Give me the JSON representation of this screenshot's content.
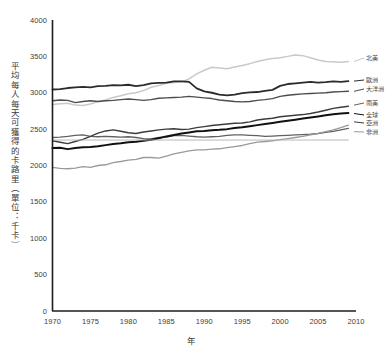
{
  "chart_data": {
    "type": "line",
    "title": "",
    "xlabel": "年",
    "ylabel": "平均每人每天可獲得的卡路里（單位：千卡）",
    "xlim": [
      1970,
      2010
    ],
    "ylim": [
      0,
      4000
    ],
    "grid": false,
    "legend_position": "right",
    "x": [
      1970,
      1971,
      1972,
      1973,
      1974,
      1975,
      1976,
      1977,
      1978,
      1979,
      1980,
      1981,
      1982,
      1983,
      1984,
      1985,
      1986,
      1987,
      1988,
      1989,
      1990,
      1991,
      1992,
      1993,
      1994,
      1995,
      1996,
      1997,
      1998,
      1999,
      2000,
      2001,
      2002,
      2003,
      2004,
      2005,
      2006,
      2007,
      2008,
      2009
    ],
    "xticks": [
      1970,
      1975,
      1980,
      1985,
      1990,
      1995,
      2000,
      2005,
      2010
    ],
    "yticks": [
      0,
      500,
      1000,
      1500,
      2000,
      2500,
      3000,
      3500,
      4000
    ],
    "series": [
      {
        "name": "北美",
        "color": "#c9c9c9",
        "width": 1.5,
        "values": [
          2840,
          2850,
          2855,
          2830,
          2825,
          2845,
          2880,
          2900,
          2935,
          2960,
          2985,
          3000,
          3030,
          3075,
          3100,
          3130,
          3140,
          3150,
          3190,
          3260,
          3310,
          3350,
          3340,
          3330,
          3355,
          3375,
          3400,
          3430,
          3455,
          3470,
          3480,
          3500,
          3520,
          3510,
          3480,
          3450,
          3430,
          3425,
          3420,
          3430
        ]
      },
      {
        "name": "歐洲",
        "color": "#2b2b2b",
        "width": 1.8,
        "values": [
          3045,
          3050,
          3065,
          3075,
          3080,
          3075,
          3090,
          3095,
          3105,
          3100,
          3110,
          3090,
          3105,
          3130,
          3135,
          3140,
          3155,
          3155,
          3150,
          3060,
          3020,
          3000,
          2975,
          2965,
          2975,
          2995,
          3005,
          3010,
          3025,
          3040,
          3095,
          3120,
          3130,
          3140,
          3150,
          3140,
          3145,
          3155,
          3150,
          3160
        ]
      },
      {
        "name": "大洋洲",
        "color": "#4d4d4d",
        "width": 1.4,
        "values": [
          2890,
          2900,
          2895,
          2865,
          2880,
          2890,
          2880,
          2890,
          2895,
          2905,
          2915,
          2905,
          2895,
          2905,
          2925,
          2930,
          2935,
          2940,
          2950,
          2940,
          2930,
          2920,
          2900,
          2890,
          2880,
          2875,
          2880,
          2895,
          2905,
          2920,
          2950,
          2965,
          2975,
          2985,
          2990,
          2995,
          3000,
          3010,
          3015,
          3020
        ]
      },
      {
        "name": "南美",
        "color": "#616161",
        "width": 1.3,
        "values": [
          2385,
          2390,
          2400,
          2415,
          2420,
          2400,
          2395,
          2400,
          2395,
          2390,
          2395,
          2385,
          2370,
          2365,
          2385,
          2390,
          2410,
          2415,
          2405,
          2395,
          2390,
          2395,
          2400,
          2415,
          2420,
          2420,
          2415,
          2410,
          2400,
          2405,
          2410,
          2415,
          2420,
          2425,
          2430,
          2440,
          2455,
          2470,
          2490,
          2510
        ]
      },
      {
        "name": "全球",
        "color": "#111111",
        "width": 2.0,
        "values": [
          2240,
          2245,
          2225,
          2240,
          2250,
          2255,
          2265,
          2280,
          2295,
          2305,
          2320,
          2325,
          2340,
          2355,
          2375,
          2400,
          2420,
          2440,
          2455,
          2470,
          2475,
          2485,
          2490,
          2500,
          2515,
          2525,
          2540,
          2555,
          2570,
          2585,
          2600,
          2615,
          2630,
          2645,
          2660,
          2675,
          2690,
          2705,
          2715,
          2720
        ]
      },
      {
        "name": "亞洲",
        "color": "#3c3c3c",
        "width": 1.4,
        "values": [
          2340,
          2320,
          2300,
          2330,
          2360,
          2400,
          2445,
          2475,
          2490,
          2470,
          2450,
          2440,
          2460,
          2475,
          2490,
          2500,
          2505,
          2495,
          2500,
          2520,
          2535,
          2550,
          2560,
          2570,
          2580,
          2585,
          2600,
          2625,
          2640,
          2650,
          2670,
          2680,
          2690,
          2700,
          2715,
          2735,
          2760,
          2785,
          2800,
          2815
        ]
      },
      {
        "name": "非洲",
        "color": "#9a9a9a",
        "width": 1.3,
        "values": [
          1975,
          1960,
          1955,
          1965,
          1985,
          1975,
          2000,
          2010,
          2040,
          2055,
          2075,
          2085,
          2110,
          2110,
          2100,
          2130,
          2160,
          2180,
          2200,
          2215,
          2215,
          2225,
          2230,
          2245,
          2260,
          2275,
          2300,
          2320,
          2330,
          2340,
          2355,
          2370,
          2385,
          2400,
          2420,
          2440,
          2465,
          2490,
          2520,
          2555
        ]
      },
      {
        "name": "參考線",
        "color": "#b0b0b0",
        "width": 0.9,
        "values": [
          2350,
          2350,
          2350,
          2350,
          2350,
          2350,
          2350,
          2350,
          2350,
          2350,
          2350,
          2350,
          2350,
          2350,
          2350,
          2350,
          2350,
          2350,
          2350,
          2350,
          2350,
          2350,
          2350,
          2350,
          2350,
          2350,
          2350,
          2350,
          2350,
          2350,
          2350,
          2350,
          2350,
          2350,
          2350,
          2350,
          2350,
          2350,
          2350,
          2350
        ]
      }
    ],
    "legend_entries": [
      {
        "label": "北美",
        "color": "#c9c9c9",
        "y": 3430
      },
      {
        "label": "歐洲",
        "color": "#2b2b2b",
        "y": 3160
      },
      {
        "label": "大洋洲",
        "color": "#4d4d4d",
        "y": 3020
      },
      {
        "label": "南美",
        "color": "#616161",
        "y": 2830
      },
      {
        "label": "全球",
        "color": "#111111",
        "y": 2715
      },
      {
        "label": "亞洲",
        "color": "#3c3c3c",
        "y": 2600
      },
      {
        "label": "非洲",
        "color": "#9a9a9a",
        "y": 2465
      }
    ]
  },
  "axes": {
    "y_tick_labels": [
      "4000",
      "3500",
      "3000",
      "2500",
      "2000",
      "1500",
      "1000",
      "500",
      "0"
    ],
    "x_tick_labels": [
      "1970",
      "1975",
      "1980",
      "1985",
      "1990",
      "1995",
      "2000",
      "2005",
      "2010"
    ],
    "y_title": "平均每人每天可獲得的卡路里（單位：千卡）",
    "x_title": "年",
    "axis_color": "#1c1c1c"
  }
}
